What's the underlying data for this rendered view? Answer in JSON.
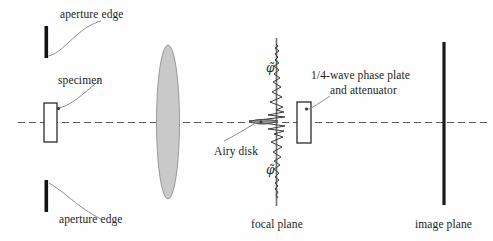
{
  "figure": {
    "background_color": "#fefefe",
    "ink_color": "#1d1d1d",
    "lens_fill": "#c9c9c9",
    "lens_stroke": "#8a8a8a",
    "axis_color": "#5a5a5a"
  },
  "labels": {
    "aperture_edge_top": "aperture edge",
    "aperture_edge_bottom": "aperture edge",
    "specimen": "specimen",
    "airy_disk": "Airy disk",
    "phase_plate_line1": "1/4-wave phase plate",
    "phase_plate_line2": "and attenuator",
    "focal_plane": "focal plane",
    "image_plane": "image plane"
  },
  "symbols": {
    "phase_shift_top": "φ̃",
    "phase_shift_bottom": "φ̃"
  },
  "elements": {
    "aperture_bar_top": "aperture-edge-bar-top",
    "aperture_bar_bottom": "aperture-edge-bar-bottom",
    "specimen_slab": "specimen-slab",
    "lens": "objective-lens",
    "optical_axis": "optical-axis",
    "focal_plane_line": "focal-plane-line",
    "image_plane_line": "image-plane-line",
    "phase_plate": "phase-plate-rectangle",
    "diffraction_profile": "diffraction-intensity-profile"
  }
}
